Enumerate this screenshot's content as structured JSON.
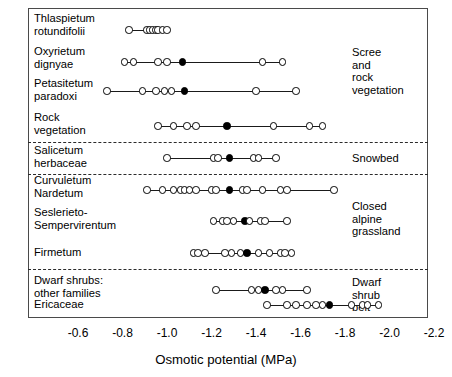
{
  "chart_data": {
    "type": "scatter",
    "title": "",
    "xlabel": "Osmotic potential (MPa)",
    "ylabel": "",
    "xlim": [
      -0.5,
      -2.3
    ],
    "xticks": [
      -0.6,
      -0.8,
      -1.0,
      -1.2,
      -1.4,
      -1.6,
      -1.8,
      -2.0,
      -2.2
    ],
    "xticklabels": [
      "-0.6",
      "-0.8",
      "-1.0",
      "-1.2",
      "-1.4",
      "-1.6",
      "-1.8",
      "-2.0",
      "-2.2"
    ],
    "grid": false,
    "legend": "none",
    "marker_note": "open circles = individual species values; filled circle = mean",
    "groups": [
      {
        "label": "Scree\nand\nrock\nvegetation",
        "rows": [
          {
            "label": "Thlaspietum\nrotundifolii",
            "range": [
              -0.83,
              -1.0
            ],
            "mean": -0.93,
            "values": [
              -0.83,
              -0.91,
              -0.92,
              -0.935,
              -0.95,
              -0.96,
              -0.98,
              -1.0
            ]
          },
          {
            "label": "Oxyrietum\ndignyae",
            "range": [
              -0.81,
              -1.52
            ],
            "mean": -1.07,
            "values": [
              -0.81,
              -0.85,
              -0.96,
              -1.0,
              -1.07,
              -1.43,
              -1.52
            ]
          },
          {
            "label": "Petasitetum\nparadoxi",
            "range": [
              -0.73,
              -1.58
            ],
            "mean": -1.08,
            "values": [
              -0.73,
              -0.89,
              -0.95,
              -0.99,
              -1.02,
              -1.08,
              -1.4,
              -1.58
            ]
          },
          {
            "label": "Rock\nvegetation",
            "range": [
              -0.96,
              -1.7
            ],
            "mean": -1.27,
            "values": [
              -0.96,
              -1.03,
              -1.09,
              -1.13,
              -1.27,
              -1.48,
              -1.64,
              -1.7
            ]
          }
        ]
      },
      {
        "label": "Snowbed",
        "rows": [
          {
            "label": "Salicetum\nherbaceae",
            "range": [
              -1.0,
              -1.49
            ],
            "mean": -1.28,
            "values": [
              -1.0,
              -1.21,
              -1.23,
              -1.28,
              -1.39,
              -1.41,
              -1.49
            ]
          }
        ]
      },
      {
        "label": "Closed\nalpine\ngrassland",
        "rows": [
          {
            "label": "Curvuletum\nNardetum",
            "range": [
              -0.91,
              -1.75
            ],
            "mean": -1.28,
            "values": [
              -0.91,
              -0.98,
              -1.03,
              -1.06,
              -1.08,
              -1.1,
              -1.13,
              -1.2,
              -1.22,
              -1.28,
              -1.34,
              -1.36,
              -1.43,
              -1.51,
              -1.54,
              -1.75
            ]
          },
          {
            "label": "Seslerieto-\nSempervirentum",
            "range": [
              -1.21,
              -1.54
            ],
            "mean": -1.35,
            "values": [
              -1.21,
              -1.25,
              -1.27,
              -1.3,
              -1.35,
              -1.37,
              -1.42,
              -1.44,
              -1.54
            ]
          },
          {
            "label": "Firmetum",
            "range": [
              -1.12,
              -1.56
            ],
            "mean": -1.36,
            "values": [
              -1.12,
              -1.14,
              -1.17,
              -1.26,
              -1.29,
              -1.33,
              -1.36,
              -1.41,
              -1.46,
              -1.51,
              -1.53,
              -1.56
            ]
          }
        ]
      },
      {
        "label": "Dwarf\nshrub\nbelt",
        "rows": [
          {
            "label": "Dwarf shrubs:\nother families",
            "range": [
              -1.22,
              -1.63
            ],
            "mean": -1.44,
            "values": [
              -1.22,
              -1.38,
              -1.41,
              -1.44,
              -1.49,
              -1.52,
              -1.63
            ]
          },
          {
            "label": "Ericaceae",
            "range": [
              -1.45,
              -1.95
            ],
            "mean": -1.73,
            "values": [
              -1.45,
              -1.54,
              -1.58,
              -1.63,
              -1.67,
              -1.7,
              -1.73,
              -1.83,
              -1.88,
              -1.9,
              -1.95
            ]
          }
        ]
      }
    ]
  },
  "axis": {
    "title": "Osmotic potential (MPa)",
    "ticks": [
      "-0.6",
      "-0.8",
      "-1.0",
      "-1.2",
      "-1.4",
      "-1.6",
      "-1.8",
      "-2.0",
      "-2.2"
    ]
  }
}
